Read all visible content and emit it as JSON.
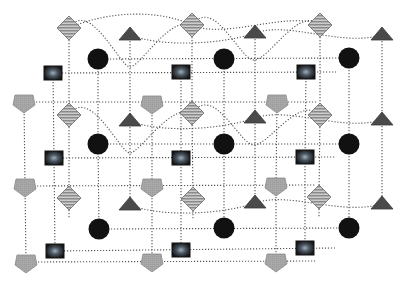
{
  "diagram": {
    "type": "node-link network",
    "width": 407,
    "height": 282,
    "colors": {
      "background": "#ffffff",
      "edge": "#555555",
      "diamond_fill": "#8a8a8a",
      "diamond_stripe": "#dcdcdc",
      "triangle_fill": "#4a4a4a",
      "circle_fill": "#111111",
      "square_fill": "#1a1a1a",
      "square_glow": "#7a8a95",
      "pentagon_fill": "#a8a8a8"
    },
    "node_types": [
      "diamond-striped",
      "triangle",
      "circle",
      "square-glow",
      "pentagon"
    ],
    "layers": [
      {
        "diamonds": [
          [
            69,
            28
          ],
          [
            192,
            25
          ],
          [
            320,
            25
          ]
        ],
        "triangles": [
          [
            130,
            35
          ],
          [
            255,
            33
          ],
          [
            382,
            35
          ]
        ],
        "circles": [
          [
            98,
            59
          ],
          [
            224,
            59
          ],
          [
            349,
            58
          ]
        ],
        "squares": [
          [
            53,
            73
          ],
          [
            181,
            72
          ],
          [
            306,
            72
          ]
        ],
        "pentagons": [
          [
            24,
            102
          ],
          [
            152,
            103
          ],
          [
            277,
            102
          ]
        ]
      },
      {
        "diamonds": [
          [
            69,
            115
          ],
          [
            192,
            113
          ],
          [
            320,
            115
          ]
        ],
        "triangles": [
          [
            130,
            121
          ],
          [
            255,
            118
          ],
          [
            382,
            120
          ]
        ],
        "circles": [
          [
            98,
            144
          ],
          [
            224,
            144
          ],
          [
            349,
            144
          ]
        ],
        "squares": [
          [
            54,
            158
          ],
          [
            181,
            158
          ],
          [
            305,
            157
          ]
        ],
        "pentagons": [
          [
            25,
            186
          ],
          [
            152,
            186
          ],
          [
            276,
            185
          ]
        ]
      },
      {
        "diamonds": [
          [
            69,
            198
          ],
          [
            193,
            199
          ],
          [
            319,
            197
          ]
        ],
        "triangles": [
          [
            130,
            205
          ],
          [
            255,
            203
          ],
          [
            382,
            204
          ]
        ],
        "circles": [
          [
            99,
            229
          ],
          [
            224,
            228
          ],
          [
            349,
            228
          ]
        ],
        "squares": [
          [
            55,
            251
          ],
          [
            181,
            250
          ],
          [
            305,
            248
          ]
        ],
        "pentagons": [
          [
            26,
            262
          ],
          [
            152,
            261
          ],
          [
            276,
            261
          ]
        ]
      }
    ]
  }
}
